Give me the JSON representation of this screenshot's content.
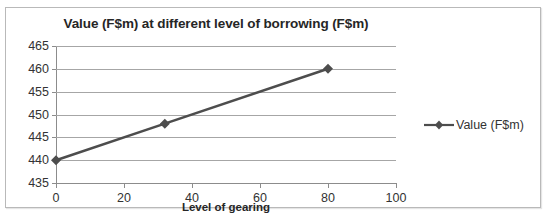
{
  "chart_data": {
    "type": "line",
    "title": "Value (F$m) at different level of borrowing  (F$m)",
    "xlabel": "Level of gearing",
    "ylabel": "",
    "xlim": [
      0,
      100
    ],
    "ylim": [
      435,
      465
    ],
    "xticks": [
      "0",
      "20",
      "40",
      "60",
      "80",
      "100"
    ],
    "xtick_values": [
      0,
      20,
      40,
      60,
      80,
      100
    ],
    "yticks": [
      "435",
      "440",
      "445",
      "450",
      "455",
      "460",
      "465"
    ],
    "ytick_values": [
      435,
      440,
      445,
      450,
      455,
      460,
      465
    ],
    "grid": true,
    "legend_position": "right",
    "series": [
      {
        "name": "Value (F$m)",
        "color": "#4d4d4d",
        "marker": "diamond",
        "x": [
          0,
          32,
          80
        ],
        "values": [
          440,
          448,
          460
        ]
      }
    ]
  },
  "legend": {
    "entries": [
      {
        "label": "Value (F$m)"
      }
    ]
  }
}
